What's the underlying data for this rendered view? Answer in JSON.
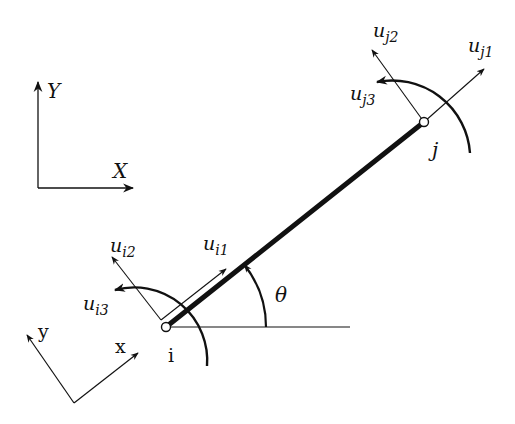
{
  "diagram": {
    "type": "2D frame element with local and global coordinate systems",
    "global_axes": {
      "x_label": "X",
      "y_label": "Y"
    },
    "local_axes": {
      "x_label": "x",
      "y_label": "y"
    },
    "nodes": [
      {
        "id": "i",
        "label": "i"
      },
      {
        "id": "j",
        "label": "j"
      }
    ],
    "angle_label": "θ",
    "node_i_dofs": [
      {
        "base": "u",
        "sub": "i1"
      },
      {
        "base": "u",
        "sub": "i2"
      },
      {
        "base": "u",
        "sub": "i3"
      }
    ],
    "node_j_dofs": [
      {
        "base": "u",
        "sub": "j1"
      },
      {
        "base": "u",
        "sub": "j2"
      },
      {
        "base": "u",
        "sub": "j3"
      }
    ],
    "colors": {
      "ink": "#111111",
      "background": "#ffffff"
    }
  }
}
